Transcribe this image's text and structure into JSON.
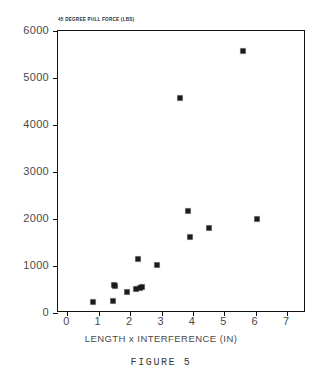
{
  "figure": {
    "caption": "FIGURE 5"
  },
  "chart_data": {
    "type": "scatter",
    "title": "45 DEGREE PULL FORCE (LBS)",
    "xlabel": "LENGTH x INTERFERENCE (IN)",
    "ylabel": "",
    "xlim": [
      -0.3,
      7.6
    ],
    "ylim": [
      0,
      6000
    ],
    "grid": false,
    "legend": null,
    "xticks": [
      0,
      1,
      2,
      3,
      4,
      5,
      6,
      7
    ],
    "xtick_labels": [
      "0",
      "1",
      "2",
      "3",
      "4",
      "5",
      "6",
      "7"
    ],
    "yticks": [
      0,
      1000,
      2000,
      3000,
      4000,
      5000,
      6000
    ],
    "ytick_labels": [
      "0",
      "1000",
      "2000",
      "3000",
      "4000",
      "5000",
      "6000"
    ],
    "marker": "square",
    "marker_color": "#1b1b1b",
    "points": [
      {
        "x": 0.8,
        "y": 230
      },
      {
        "x": 1.45,
        "y": 250
      },
      {
        "x": 1.48,
        "y": 600
      },
      {
        "x": 1.52,
        "y": 565
      },
      {
        "x": 1.9,
        "y": 440
      },
      {
        "x": 2.2,
        "y": 505
      },
      {
        "x": 2.3,
        "y": 535
      },
      {
        "x": 2.38,
        "y": 545
      },
      {
        "x": 2.25,
        "y": 1150
      },
      {
        "x": 2.85,
        "y": 1020
      },
      {
        "x": 3.6,
        "y": 4580
      },
      {
        "x": 3.85,
        "y": 2180
      },
      {
        "x": 3.9,
        "y": 1620
      },
      {
        "x": 4.5,
        "y": 1800
      },
      {
        "x": 5.6,
        "y": 5580
      },
      {
        "x": 6.05,
        "y": 1990
      }
    ]
  }
}
